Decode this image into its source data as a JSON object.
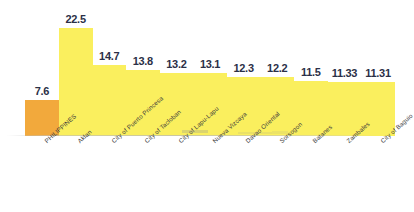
{
  "chart_data": {
    "type": "bar",
    "title": "",
    "subtitle": "",
    "xlabel": "",
    "ylabel": "",
    "ylim": [
      0,
      24
    ],
    "grid": false,
    "legend": "none",
    "orientation": "vertical",
    "value_label_position": "above-bar",
    "category_label_rotation": -42,
    "categories": [
      "PHILIPPINES",
      "Aklan",
      "City of Puerto Princesa",
      "City of Tacloban",
      "City of Lapu-Lapu",
      "Nueva Vizcaya",
      "Davao Oriental",
      "Sorsogon",
      "Batanes",
      "Zambales",
      "City of Baguio"
    ],
    "values": [
      7.6,
      22.5,
      14.7,
      13.8,
      13.2,
      13.1,
      12.3,
      12.2,
      11.5,
      11.33,
      11.31
    ],
    "value_labels": [
      "7.6",
      "22.5",
      "14.7",
      "13.8",
      "13.2",
      "13.1",
      "12.3",
      "12.2",
      "11.5",
      "11.33",
      "11.31"
    ],
    "bar_colors": [
      "#F2A93C",
      "#FAEF5E",
      "#FAEF5E",
      "#FAEF5E",
      "#FAEF5E",
      "#FAEF5E",
      "#FAEF5E",
      "#FAEF5E",
      "#FAEF5E",
      "#FAEF5E",
      "#FAEF5E"
    ],
    "highlight_category": "PHILIPPINES",
    "highlight_color": "#F2A93C",
    "series_color": "#FAEF5E",
    "value_label_color": "#2B3047",
    "category_label_color": "#3A3A3A",
    "background_color": "#FFFFFF",
    "baseline_color": "#BEBEBE"
  }
}
